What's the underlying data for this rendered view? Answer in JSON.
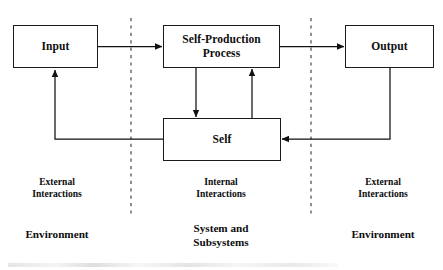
{
  "diagram": {
    "type": "block-flow-diagram",
    "colors": {
      "stroke": "#1a1a1a",
      "text": "#0d0d0d",
      "background": "#ffffff",
      "divider": "#555555"
    },
    "nodes": [
      {
        "id": "input",
        "label": "Input",
        "x": 13,
        "y": 25,
        "w": 85,
        "h": 43
      },
      {
        "id": "self_production_process",
        "label": "Self-Production\nProcess",
        "x": 163,
        "y": 25,
        "w": 117,
        "h": 43
      },
      {
        "id": "output",
        "label": "Output",
        "x": 345,
        "y": 25,
        "w": 89,
        "h": 43
      },
      {
        "id": "self",
        "label": "Self",
        "x": 163,
        "y": 118,
        "w": 118,
        "h": 43
      }
    ],
    "edges": [
      {
        "id": "input-to-process",
        "from": "input",
        "to": "self_production_process",
        "direction": "right"
      },
      {
        "id": "process-to-output",
        "from": "self_production_process",
        "to": "output",
        "direction": "right"
      },
      {
        "id": "process-to-self",
        "from": "self_production_process",
        "to": "self",
        "direction": "down"
      },
      {
        "id": "self-to-process",
        "from": "self",
        "to": "self_production_process",
        "direction": "up"
      },
      {
        "id": "self-to-input",
        "from": "self",
        "to": "input",
        "direction": "feedback-left-up"
      },
      {
        "id": "output-to-self",
        "from": "output",
        "to": "self",
        "direction": "feedback-down-left"
      }
    ],
    "dividers": [
      {
        "id": "left-divider",
        "x": 131,
        "y1": 18,
        "y2": 215,
        "style": "dashed"
      },
      {
        "id": "right-divider",
        "x": 311,
        "y1": 18,
        "y2": 215,
        "style": "dashed"
      }
    ],
    "zones": [
      {
        "id": "left-zone",
        "interactions_label": "External\nInteractions",
        "environment_label": "Environment",
        "center_x": 57,
        "interactions_y": 176,
        "environment_y": 228
      },
      {
        "id": "middle-zone",
        "interactions_label": "Internal\nInteractions",
        "environment_label": "System and\nSubsystems",
        "center_x": 221,
        "interactions_y": 176,
        "environment_y": 228
      },
      {
        "id": "right-zone",
        "interactions_label": "External\nInteractions",
        "environment_label": "Environment",
        "center_x": 383,
        "interactions_y": 176,
        "environment_y": 228
      }
    ]
  }
}
